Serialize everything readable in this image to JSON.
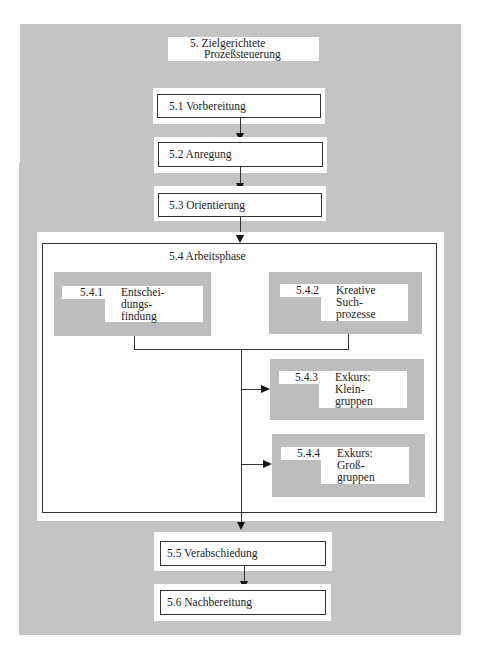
{
  "diagram": {
    "title": {
      "line1": "5. Zielgerichtete",
      "line2": "Prozeßsteuerung"
    },
    "steps": [
      {
        "id": "5.1",
        "label": "5.1 Vorbereitung"
      },
      {
        "id": "5.2",
        "label": "5.2 Anregung"
      },
      {
        "id": "5.3",
        "label": "5.3 Orientierung"
      },
      {
        "id": "5.4",
        "label": "5.4 Arbeitsphase"
      },
      {
        "id": "5.5",
        "label": "5.5 Verabschiedung"
      },
      {
        "id": "5.6",
        "label": "5.6 Nachbereitung"
      }
    ],
    "substeps": [
      {
        "num": "5.4.1",
        "lines": [
          "Entschei-",
          "dungs-",
          "findung"
        ]
      },
      {
        "num": "5.4.2",
        "lines": [
          "Kreative",
          "Such-",
          "prozesse"
        ]
      },
      {
        "num": "5.4.3",
        "lines": [
          "Exkurs:",
          "Klein-",
          "gruppen"
        ]
      },
      {
        "num": "5.4.4",
        "lines": [
          "Exkurs:",
          "Groß-",
          "gruppen"
        ]
      }
    ],
    "colors": {
      "panel": "#c4c4c4",
      "box": "#ffffff",
      "border": "#333333"
    }
  }
}
